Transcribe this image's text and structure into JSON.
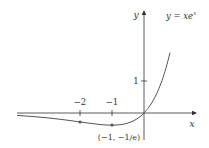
{
  "chart_data": {
    "type": "line",
    "title": "",
    "function_label": "y = xe^x",
    "function_label_parts": {
      "base": "y = xe",
      "exponent": "x"
    },
    "xlabel": "x",
    "ylabel": "y",
    "x_ticks": [
      {
        "value": -2,
        "label": "−2"
      },
      {
        "value": -1,
        "label": "−1"
      }
    ],
    "y_ticks": [
      {
        "value": 1,
        "label": "1"
      }
    ],
    "highlighted_points": [
      {
        "x": -2,
        "y": -0.271,
        "label": ""
      },
      {
        "x": -1,
        "y": -0.368,
        "label": "(−1, −1/e)"
      }
    ],
    "series": [
      {
        "name": "y = xe^x",
        "x": [
          -4,
          -3.5,
          -3,
          -2.5,
          -2,
          -1.5,
          -1,
          -0.5,
          0,
          0.25,
          0.5,
          0.75,
          1,
          1.2
        ],
        "values": [
          -0.073,
          -0.106,
          -0.149,
          -0.205,
          -0.271,
          -0.335,
          -0.368,
          -0.303,
          0,
          0.321,
          0.824,
          1.588,
          2.718,
          3.984
        ]
      }
    ],
    "xlim": [
      -4,
      2
    ],
    "ylim": [
      -0.7,
      3.3
    ],
    "grid": false,
    "legend": "none",
    "colors": {
      "curve": "#555555",
      "axes": "#333333",
      "points": "#555555"
    }
  }
}
